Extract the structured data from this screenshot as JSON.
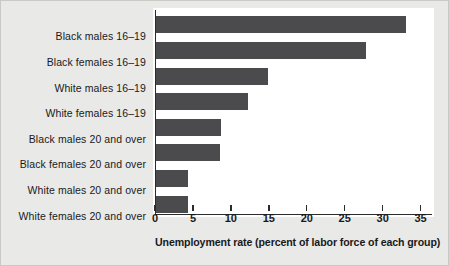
{
  "chart_data": {
    "type": "bar",
    "orientation": "horizontal",
    "title": "",
    "xlabel": "Unemployment rate (percent of labor force of each group)",
    "ylabel": "",
    "xlim": [
      0,
      36.5
    ],
    "xticks": [
      0,
      5,
      10,
      15,
      20,
      25,
      30,
      35
    ],
    "xtick_labels": [
      "0",
      "5",
      "10",
      "15",
      "20",
      "25",
      "30",
      "35"
    ],
    "grid": false,
    "legend": null,
    "bar_color": "#4b4b4d",
    "background_color": "#e9e9e7",
    "plot_background_color": "#ffffff",
    "axis_color": "#2b2b2d",
    "categories": [
      "Black males 16–19",
      "Black females 16–19",
      "White males 16–19",
      "White females 16–19",
      "Black males 20 and over",
      "Black females 20 and over",
      "White males 20 and over",
      "White females 20 and over"
    ],
    "values": [
      32.9,
      27.7,
      14.8,
      12.1,
      8.6,
      8.4,
      4.2,
      4.2
    ]
  }
}
